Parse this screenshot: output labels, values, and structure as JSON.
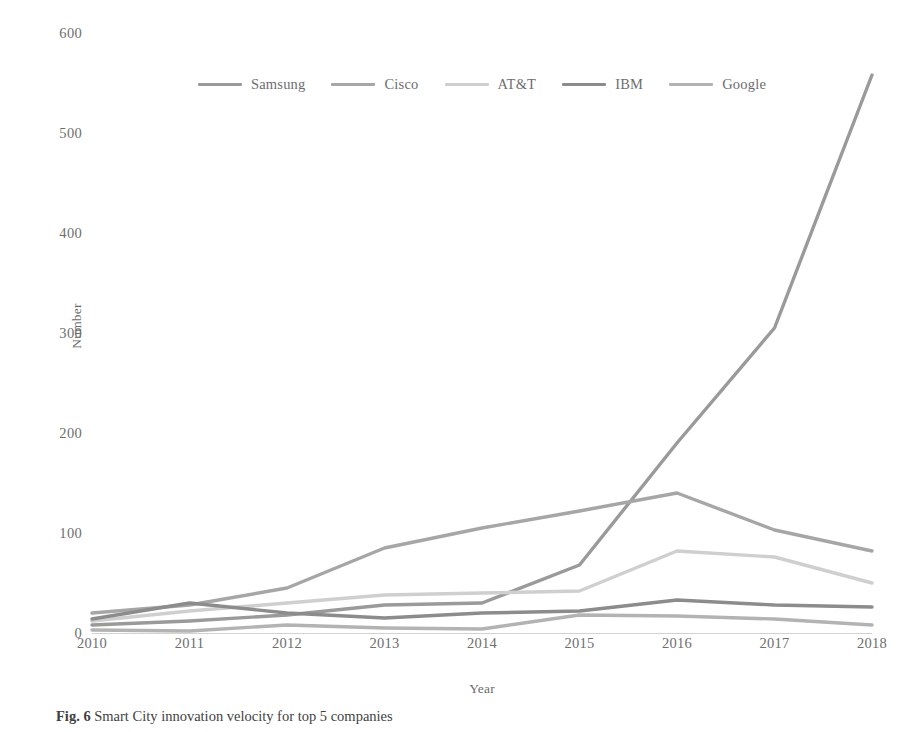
{
  "chart_data": {
    "type": "line",
    "title": "",
    "xlabel": "Year",
    "ylabel": "Number",
    "x": [
      2010,
      2011,
      2012,
      2013,
      2014,
      2015,
      2016,
      2017,
      2018
    ],
    "categories": [
      "2010",
      "2011",
      "2012",
      "2013",
      "2014",
      "2015",
      "2016",
      "2017",
      "2018"
    ],
    "xlim": [
      2010,
      2018
    ],
    "ylim": [
      0,
      600
    ],
    "yticks": [
      0,
      100,
      200,
      300,
      400,
      500,
      600
    ],
    "ytick_labels": [
      "0",
      "100",
      "200",
      "300",
      "400",
      "500",
      "600"
    ],
    "grid": false,
    "legend_position": "top-center",
    "series": [
      {
        "name": "Samsung",
        "color": "#9a9a9a",
        "values": [
          8,
          12,
          18,
          28,
          30,
          68,
          190,
          305,
          558
        ]
      },
      {
        "name": "Cisco",
        "color": "#a6a6a6",
        "values": [
          20,
          28,
          45,
          85,
          105,
          122,
          140,
          103,
          82
        ]
      },
      {
        "name": "AT&T",
        "color": "#cfcfcf",
        "values": [
          12,
          22,
          30,
          38,
          40,
          42,
          82,
          76,
          50
        ]
      },
      {
        "name": "IBM",
        "color": "#8c8c8c",
        "values": [
          14,
          30,
          20,
          15,
          20,
          22,
          33,
          28,
          26
        ]
      },
      {
        "name": "Google",
        "color": "#b3b3b3",
        "values": [
          3,
          2,
          8,
          5,
          4,
          18,
          17,
          14,
          8
        ]
      }
    ]
  },
  "axes": {
    "y_title": "Number",
    "x_title": "Year",
    "y_ticks": [
      "600",
      "500",
      "400",
      "300",
      "200",
      "100",
      "0"
    ],
    "x_ticks": [
      "2010",
      "2011",
      "2012",
      "2013",
      "2014",
      "2015",
      "2016",
      "2017",
      "2018"
    ]
  },
  "legend": {
    "items": [
      {
        "label": "Samsung",
        "color": "#9a9a9a"
      },
      {
        "label": "Cisco",
        "color": "#a6a6a6"
      },
      {
        "label": "AT&T",
        "color": "#cfcfcf"
      },
      {
        "label": "IBM",
        "color": "#8c8c8c"
      },
      {
        "label": "Google",
        "color": "#b3b3b3"
      }
    ]
  },
  "caption": {
    "figure_number": "Fig. 6",
    "text": "Smart City innovation velocity for top 5 companies"
  }
}
